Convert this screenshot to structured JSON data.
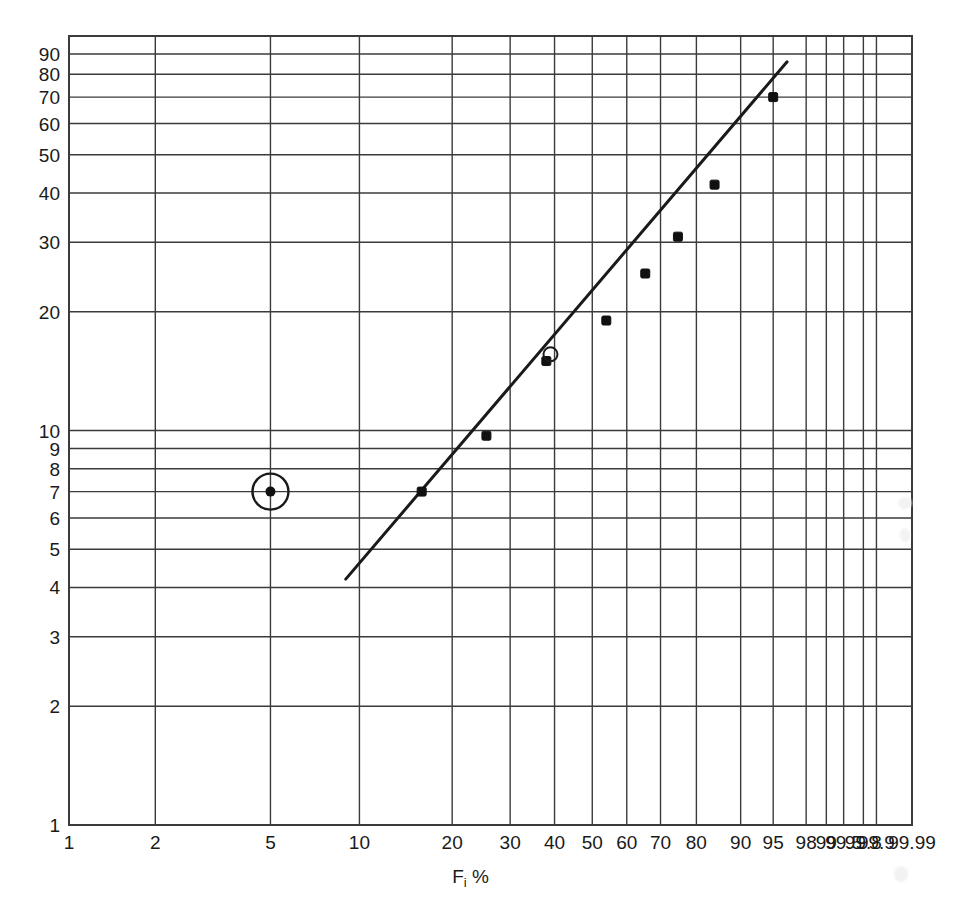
{
  "chart_data": {
    "type": "scatter",
    "title": "",
    "subtitle": "",
    "xlabel": "F i %",
    "ylabel": "",
    "grid": true,
    "legend": "none",
    "x_scale": "weibull-probability",
    "y_scale": "log",
    "xlim": [
      1,
      99.99
    ],
    "ylim": [
      1,
      100
    ],
    "x_ticks": [
      "1",
      "2",
      "5",
      "10",
      "20",
      "30",
      "40",
      "50",
      "60",
      "70",
      "80",
      "90",
      "95",
      "98",
      "99",
      "99.5",
      "99.8",
      "99.9",
      "99.99"
    ],
    "y_ticks": [
      "1",
      "2",
      "3",
      "4",
      "5",
      "6",
      "7",
      "8",
      "9",
      "10",
      "20",
      "30",
      "40",
      "50",
      "60",
      "70",
      "80",
      "90"
    ],
    "series": [
      {
        "name": "ranked failure data",
        "marker": "filled-square",
        "x": [
          16.0,
          25.5,
          38.0,
          54.0,
          65.5,
          75.0,
          84.5,
          95.0
        ],
        "y": [
          7.0,
          9.7,
          15.0,
          19.0,
          25.0,
          31.0,
          42.0,
          70.0
        ]
      },
      {
        "name": "highlighted point (circled)",
        "marker": "dot-in-circle",
        "x": [
          5.0
        ],
        "y": [
          7.0
        ]
      },
      {
        "name": "open circle annotation",
        "marker": "open-circle",
        "x": [
          39.0
        ],
        "y": [
          15.6
        ]
      }
    ],
    "fit_line": {
      "name": "best-fit line",
      "x_start": 9.0,
      "y_start": 4.2,
      "x_end": 96.5,
      "y_end": 86.0
    },
    "annotations": [
      {
        "name": "circled-data-point",
        "text": "",
        "x": 5.0,
        "y": 7.0
      }
    ]
  },
  "axes": {
    "x_tick_labels": [
      "1",
      "2",
      "5",
      "10",
      "20",
      "30",
      "40",
      "50",
      "60",
      "70",
      "80",
      "90",
      "95",
      "98",
      "99",
      "99.5",
      "99.8",
      "99.9",
      "99.99"
    ],
    "y_tick_labels": [
      "1",
      "2",
      "3",
      "4",
      "5",
      "6",
      "7",
      "8",
      "9",
      "10",
      "20",
      "30",
      "40",
      "50",
      "60",
      "70",
      "80",
      "90"
    ],
    "x_title_main": "F",
    "x_title_sub": "i",
    "x_title_unit": "%"
  },
  "colors": {
    "grid": "#3b3b3b",
    "line": "#1a1a1a",
    "marker": "#111111",
    "background": "#ffffff",
    "text": "#1a1a1a"
  }
}
